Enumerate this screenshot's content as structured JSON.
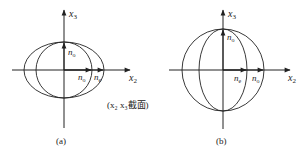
{
  "diagrams": [
    {
      "id": "a",
      "caption": "(a)",
      "axis_x_label": "x",
      "axis_x_sub": "2",
      "axis_y_label": "x",
      "axis_y_sub": "3",
      "vertical_vector_label": "n",
      "vertical_vector_sub": "o",
      "horizontal_vector_1_label": "n",
      "horizontal_vector_1_sub": "o",
      "horizontal_vector_2_label": "n",
      "horizontal_vector_2_sub": "e",
      "section_note": "(x₂ x₃截面)"
    },
    {
      "id": "b",
      "caption": "(b)",
      "axis_x_label": "x",
      "axis_x_sub": "2",
      "axis_y_label": "x",
      "axis_y_sub": "3",
      "vertical_vector_label": "n",
      "vertical_vector_sub": "o",
      "horizontal_vector_1_label": "n",
      "horizontal_vector_1_sub": "e",
      "horizontal_vector_2_label": "n",
      "horizontal_vector_2_sub": "o"
    }
  ],
  "colors": {
    "stroke": "#222222",
    "background": "#ffffff"
  }
}
